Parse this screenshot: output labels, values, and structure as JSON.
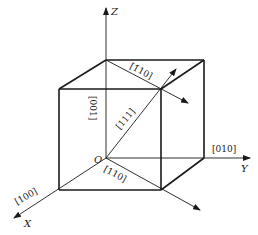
{
  "diagram": {
    "type": "cubic crystal directions",
    "axes": {
      "x": {
        "label": "X"
      },
      "y": {
        "label": "Y"
      },
      "z": {
        "label": "Z"
      },
      "origin": {
        "label": "O"
      }
    },
    "directions": [
      {
        "id": "dir-100",
        "label": "[100]"
      },
      {
        "id": "dir-010",
        "label": "[010]"
      },
      {
        "id": "dir-001",
        "label": "[001]"
      },
      {
        "id": "dir-111",
        "label": "[111]"
      },
      {
        "id": "dir-110-bottom",
        "label": "[110]"
      },
      {
        "id": "dir-1-10-top",
        "label": "[1̄10]"
      }
    ],
    "colors": {
      "line": "#1a1a1a",
      "background": "#ffffff"
    }
  }
}
